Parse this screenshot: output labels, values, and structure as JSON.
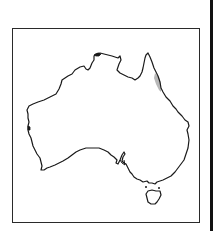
{
  "map": {
    "region": "Australia",
    "frame": {
      "border_color": "#2a2a2a"
    },
    "outline_color": "#1a1a1a",
    "highlight": {
      "label": "",
      "area": "north-east Queensland coast",
      "color": "#b8b8b8"
    }
  }
}
